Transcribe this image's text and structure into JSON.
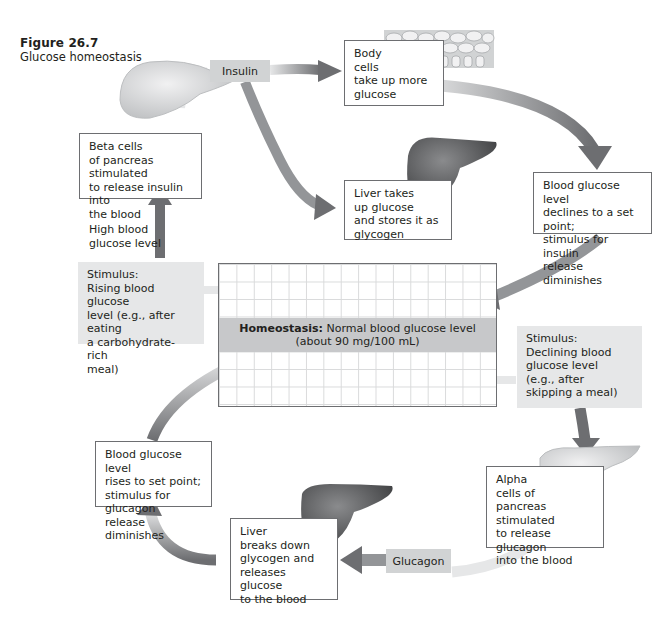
{
  "figure": {
    "number": "Figure 26.7",
    "caption": "Glucose homeostasis"
  },
  "center": {
    "homeostasis_bold": "Homeostasis:",
    "homeostasis_text": " Normal blood glucose level",
    "homeostasis_detail": "(about 90 mg/100 mL)"
  },
  "insulin_loop": {
    "stimulus": [
      "Stimulus:",
      "Rising blood glucose",
      "level (e.g., after eating",
      "a carbohydrate-rich",
      "meal)"
    ],
    "signal_label": [
      "High blood",
      "glucose level"
    ],
    "beta_cells": [
      "Beta cells",
      "of pancreas stimulated",
      "to release insulin into",
      "the blood"
    ],
    "hormone_tag": "Insulin",
    "body_cells": [
      "Body",
      "cells",
      "take up more",
      "glucose"
    ],
    "liver": [
      "Liver takes",
      "up glucose",
      "and stores it as",
      "glycogen"
    ],
    "result": [
      "Blood glucose level",
      "declines to a set point;",
      "stimulus for insulin",
      "release diminishes"
    ]
  },
  "glucagon_loop": {
    "stimulus": [
      "Stimulus:",
      "Declining blood",
      "glucose level",
      "(e.g., after",
      "skipping a meal)"
    ],
    "alpha_cells": [
      "Alpha",
      "cells of",
      "pancreas stimulated",
      "to release glucagon",
      "into the blood"
    ],
    "hormone_tag": "Glucagon",
    "liver": [
      "Liver",
      "breaks down",
      "glycogen and",
      "releases glucose",
      "to the blood"
    ],
    "result": [
      "Blood glucose level",
      "rises to set point;",
      "stimulus for glucagon",
      "release diminishes"
    ]
  },
  "colors": {
    "arrow_dark": "#6d6e71",
    "arrow_light": "#d1d3d4",
    "box_border": "#6d6e71",
    "stimulus_fill": "#e6e7e8",
    "homeostasis_bar": "#c7c8ca",
    "organ": "#58595b"
  }
}
